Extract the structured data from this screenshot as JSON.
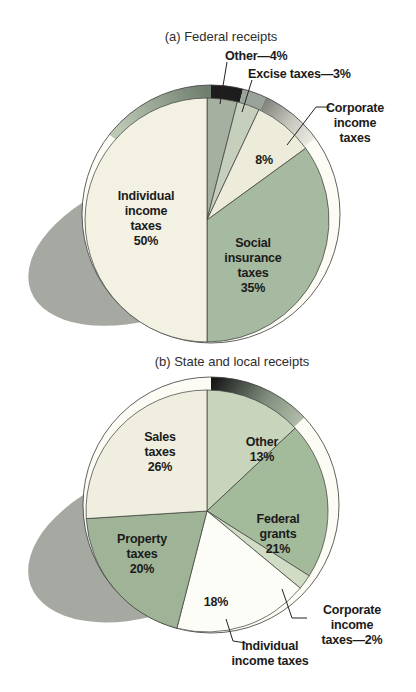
{
  "figure": {
    "panel_a_caption": "(a) Federal receipts",
    "panel_b_caption": "(b) State and local receipts"
  },
  "chart_data": [
    {
      "type": "pie",
      "title": "(a) Federal receipts",
      "unit": "%",
      "start_angle_deg": 0,
      "direction": "clockwise",
      "slices": [
        {
          "label": "Other",
          "value": 4,
          "color": "#a5b0a0"
        },
        {
          "label": "Excise taxes",
          "value": 3,
          "color": "#c6cfbc"
        },
        {
          "label": "Corporate income taxes",
          "value": 8,
          "color": "#edebda"
        },
        {
          "label": "Social insurance taxes",
          "value": 35,
          "color": "#a6b9a1"
        },
        {
          "label": "Individual income taxes",
          "value": 50,
          "color": "#f2f1e2"
        }
      ]
    },
    {
      "type": "pie",
      "title": "(b) State and local receipts",
      "unit": "%",
      "start_angle_deg": 0,
      "direction": "clockwise",
      "slices": [
        {
          "label": "Other",
          "value": 13,
          "color": "#c9d4bc"
        },
        {
          "label": "Federal grants",
          "value": 21,
          "color": "#a3ba9b"
        },
        {
          "label": "Corporate income taxes",
          "value": 2,
          "color": "#d0dcc4"
        },
        {
          "label": "Individual income taxes",
          "value": 18,
          "color": "#fdfdf8"
        },
        {
          "label": "Property taxes",
          "value": 20,
          "color": "#9fb496"
        },
        {
          "label": "Sales taxes",
          "value": 26,
          "color": "#f0efdf"
        }
      ]
    }
  ],
  "labels_a": {
    "individual": "Individual\nincome\ntaxes\n50%",
    "social": "Social\ninsurance\ntaxes\n35%",
    "corporate_pct": "8%",
    "other_callout": "Other—4%",
    "excise_callout": "Excise taxes—3%",
    "corporate_callout": "Corporate\nincome\ntaxes"
  },
  "labels_b": {
    "sales": "Sales\ntaxes\n26%",
    "other": "Other\n13%",
    "federal": "Federal\ngrants\n21%",
    "property": "Property\ntaxes\n20%",
    "individual_pct": "18%",
    "corporate_callout": "Corporate income\ntaxes—2%",
    "individual_callout": "Individual\nincome taxes"
  },
  "palette": {
    "shadow": "#a6a9a2",
    "rim_base": "#fcfbf4",
    "rim_dark": "#1d1d1d",
    "rim_gray": "#9aa39a",
    "outline": "#3a3a3a",
    "text": "#1b1b1b"
  }
}
